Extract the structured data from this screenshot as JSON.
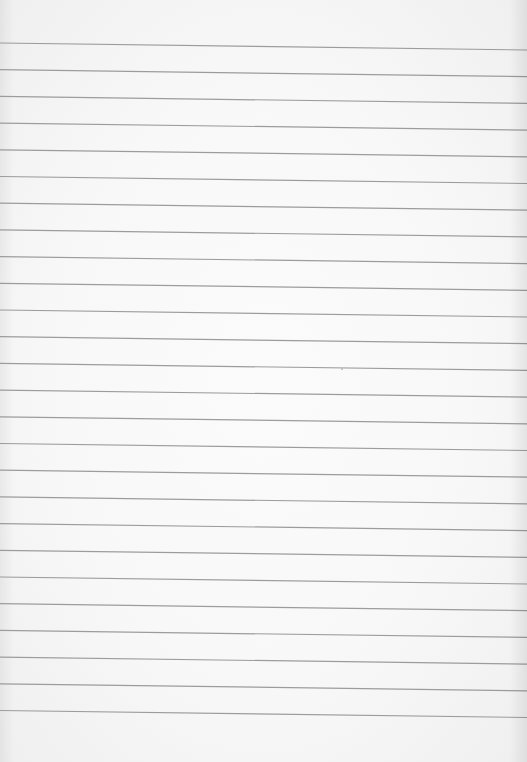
{
  "paper": {
    "type": "ruled-notebook-page",
    "background_color": "#f8f8f8",
    "line_color": "#9c9c9c",
    "line_count": 26,
    "first_line_y_left": 43,
    "first_line_y_right": 50,
    "line_spacing": 26.7,
    "line_thickness": 1.2
  },
  "marks": [
    {
      "x": 341,
      "y": 368
    }
  ]
}
